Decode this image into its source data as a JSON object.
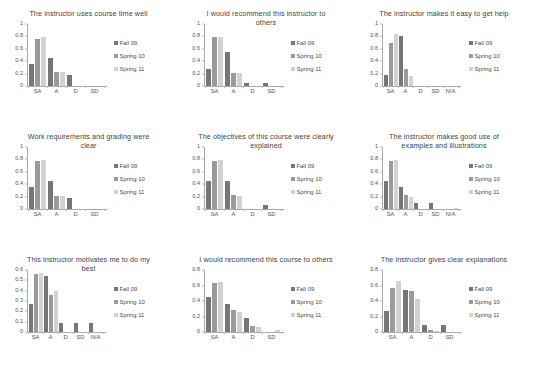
{
  "legend": {
    "series": [
      {
        "name": "Fall 09",
        "color": "#767676"
      },
      {
        "name": "Spring 10",
        "color": "#9a9a9a"
      },
      {
        "name": "Spring 11",
        "color": "#d2d2d2"
      }
    ]
  },
  "chart_data": [
    {
      "type": "bar",
      "id": "instructor-uses-course-time-well",
      "title": "The instructor uses course time well",
      "xlabel": "",
      "ylabel": "",
      "categories": [
        "SA",
        "A",
        "D",
        "SD"
      ],
      "yticks": [
        0,
        0.2,
        0.4,
        0.6,
        0.8,
        1
      ],
      "ylim": [
        0,
        1
      ],
      "grid": false,
      "legend_position": "right",
      "series": [
        {
          "name": "Fall 09",
          "values": [
            0.36,
            0.45,
            0.18,
            0
          ]
        },
        {
          "name": "Spring 10",
          "values": [
            0.76,
            0.22,
            0,
            0
          ]
        },
        {
          "name": "Spring 11",
          "values": [
            0.79,
            0.22,
            0,
            0
          ]
        }
      ]
    },
    {
      "type": "bar",
      "id": "recommend-this-instructor",
      "title": "I would recommend this instructor to others",
      "xlabel": "",
      "ylabel": "",
      "categories": [
        "SA",
        "A",
        "D",
        "SD"
      ],
      "yticks": [
        0,
        0.2,
        0.4,
        0.6,
        0.8,
        1
      ],
      "ylim": [
        0,
        1
      ],
      "grid": false,
      "legend_position": "right",
      "series": [
        {
          "name": "Fall 09",
          "values": [
            0.28,
            0.55,
            0.05,
            0.05
          ]
        },
        {
          "name": "Spring 10",
          "values": [
            0.79,
            0.21,
            0,
            0
          ]
        },
        {
          "name": "Spring 11",
          "values": [
            0.79,
            0.21,
            0,
            0
          ]
        }
      ]
    },
    {
      "type": "bar",
      "id": "instructor-makes-it-easy-to-get-help",
      "title": "The instructor makes it easy to get help",
      "xlabel": "",
      "ylabel": "",
      "categories": [
        "SA",
        "A",
        "D",
        "SD",
        "N/A"
      ],
      "yticks": [
        0,
        0.2,
        0.4,
        0.6,
        0.8,
        1
      ],
      "ylim": [
        0,
        1
      ],
      "grid": false,
      "legend_position": "right",
      "series": [
        {
          "name": "Fall 09",
          "values": [
            0.18,
            0.81,
            0,
            0,
            0
          ]
        },
        {
          "name": "Spring 10",
          "values": [
            0.7,
            0.27,
            0,
            0,
            0
          ]
        },
        {
          "name": "Spring 11",
          "values": [
            0.84,
            0.16,
            0,
            0,
            0
          ]
        }
      ]
    },
    {
      "type": "bar",
      "id": "work-requirements-and-grading-were-clear",
      "title": "Work requirements and grading were clear",
      "xlabel": "",
      "ylabel": "",
      "categories": [
        "SA",
        "A",
        "D",
        "SD"
      ],
      "yticks": [
        0,
        0.2,
        0.4,
        0.6,
        0.8,
        1
      ],
      "ylim": [
        0,
        1
      ],
      "grid": false,
      "legend_position": "right",
      "series": [
        {
          "name": "Fall 09",
          "values": [
            0.36,
            0.45,
            0.18,
            0
          ]
        },
        {
          "name": "Spring 10",
          "values": [
            0.78,
            0.21,
            0,
            0
          ]
        },
        {
          "name": "Spring 11",
          "values": [
            0.79,
            0.21,
            0,
            0
          ]
        }
      ]
    },
    {
      "type": "bar",
      "id": "objectives-clearly-explained",
      "title": "The objectives of this course were clearly explained",
      "xlabel": "",
      "ylabel": "",
      "categories": [
        "SA",
        "A",
        "D",
        "SD"
      ],
      "yticks": [
        0,
        0.2,
        0.4,
        0.6,
        0.8,
        1
      ],
      "ylim": [
        0,
        1
      ],
      "grid": false,
      "legend_position": "right",
      "series": [
        {
          "name": "Fall 09",
          "values": [
            0.45,
            0.45,
            0,
            0.06
          ]
        },
        {
          "name": "Spring 10",
          "values": [
            0.77,
            0.23,
            0,
            0
          ]
        },
        {
          "name": "Spring 11",
          "values": [
            0.79,
            0.21,
            0,
            0
          ]
        }
      ]
    },
    {
      "type": "bar",
      "id": "good-use-of-examples-and-illustrations",
      "title": "The instructor makes good use of examples and illustrations",
      "xlabel": "",
      "ylabel": "",
      "categories": [
        "SA",
        "A",
        "D",
        "SD",
        "N/A"
      ],
      "yticks": [
        0,
        0.2,
        0.4,
        0.6,
        0.8,
        1
      ],
      "ylim": [
        0,
        1
      ],
      "grid": false,
      "legend_position": "right",
      "series": [
        {
          "name": "Fall 09",
          "values": [
            0.45,
            0.36,
            0.09,
            0.09,
            0
          ]
        },
        {
          "name": "Spring 10",
          "values": [
            0.77,
            0.23,
            0,
            0,
            0
          ]
        },
        {
          "name": "Spring 11",
          "values": [
            0.79,
            0.19,
            0,
            0,
            0.02
          ]
        }
      ]
    },
    {
      "type": "bar",
      "id": "instructor-motivates-me-to-do-my-best",
      "title": "This instructor motivates me to do my best",
      "xlabel": "",
      "ylabel": "",
      "categories": [
        "SA",
        "A",
        "D",
        "SD",
        "N/A"
      ],
      "yticks": [
        0,
        0.1,
        0.2,
        0.3,
        0.4,
        0.5,
        0.6
      ],
      "ylim": [
        0,
        0.6
      ],
      "grid": false,
      "legend_position": "right",
      "series": [
        {
          "name": "Fall 09",
          "values": [
            0.27,
            0.54,
            0.09,
            0.09,
            0.09
          ]
        },
        {
          "name": "Spring 10",
          "values": [
            0.56,
            0.36,
            0,
            0,
            0
          ]
        },
        {
          "name": "Spring 11",
          "values": [
            0.57,
            0.4,
            0,
            0,
            0
          ]
        }
      ]
    },
    {
      "type": "bar",
      "id": "recommend-this-course",
      "title": "I would recommend this course to others",
      "xlabel": "",
      "ylabel": "",
      "categories": [
        "SA",
        "A",
        "D",
        "SD"
      ],
      "yticks": [
        0,
        0.2,
        0.4,
        0.6,
        0.8
      ],
      "ylim": [
        0,
        0.8
      ],
      "grid": false,
      "legend_position": "right",
      "series": [
        {
          "name": "Fall 09",
          "values": [
            0.45,
            0.36,
            0.18,
            0
          ]
        },
        {
          "name": "Spring 10",
          "values": [
            0.63,
            0.29,
            0.08,
            0
          ]
        },
        {
          "name": "Spring 11",
          "values": [
            0.65,
            0.26,
            0.07,
            0.02
          ]
        }
      ]
    },
    {
      "type": "bar",
      "id": "instructor-gives-clear-explanations",
      "title": "The instructor gives clear explanations",
      "xlabel": "",
      "ylabel": "",
      "categories": [
        "SA",
        "A",
        "D",
        "SD"
      ],
      "yticks": [
        0,
        0.2,
        0.4,
        0.6,
        0.8
      ],
      "ylim": [
        0,
        0.8
      ],
      "grid": false,
      "legend_position": "right",
      "series": [
        {
          "name": "Fall 09",
          "values": [
            0.27,
            0.54,
            0.09,
            0.09
          ]
        },
        {
          "name": "Spring 10",
          "values": [
            0.57,
            0.53,
            0.02,
            0
          ]
        },
        {
          "name": "Spring 11",
          "values": [
            0.66,
            0.43,
            0.01,
            0
          ]
        }
      ]
    }
  ]
}
